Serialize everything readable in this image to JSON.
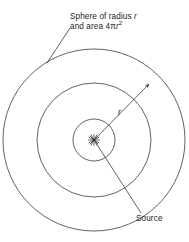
{
  "figure": {
    "background_color": "#ffffff",
    "stroke_color": "#3a3a3a",
    "text_color": "#1a1a1a"
  },
  "labels": {
    "sphere": {
      "line1_prefix": "Sphere of radius ",
      "line1_symbol": "r",
      "line2_prefix": "and area 4",
      "line2_pi": "π",
      "line2_symbol": "r",
      "line2_exponent": "2"
    },
    "radius": "r",
    "source": "Source"
  },
  "geometry": {
    "center_x": 94,
    "center_y": 140,
    "circle_radii": [
      21,
      57,
      91
    ],
    "circle_count": 3,
    "radius_arrow": {
      "from_x": 94,
      "from_y": 140,
      "to_x": 150,
      "to_y": 83
    },
    "sphere_leader": {
      "from_x": 70,
      "from_y": 28,
      "to_x": 47,
      "to_y": 63
    },
    "source_leader": {
      "from_x": 96,
      "from_y": 143,
      "to_x": 141,
      "to_y": 213
    },
    "starburst_rays": 12,
    "starburst_radius": 6
  }
}
